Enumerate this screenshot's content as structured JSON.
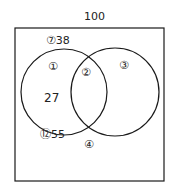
{
  "diagram": {
    "type": "venn",
    "universe_total": "100",
    "colors": {
      "stroke": "#1a1a1a",
      "text": "#222222",
      "background": "#ffffff"
    },
    "regions": [
      {
        "id": "region-1",
        "label": "①",
        "value": "27"
      },
      {
        "id": "region-2",
        "label": "②"
      },
      {
        "id": "region-3",
        "label": "③"
      },
      {
        "id": "region-4",
        "label": "④"
      }
    ],
    "annotations": {
      "top_left_circle": "⑦38",
      "bottom_left_circle": "⑫55"
    }
  }
}
